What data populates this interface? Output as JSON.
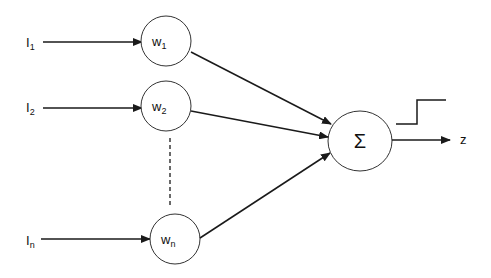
{
  "diagram": {
    "title": "",
    "type": "perceptron",
    "colors": {
      "stroke": "#1a1a1a",
      "background": "#ffffff"
    },
    "inputs": [
      {
        "base": "I",
        "sub": "1"
      },
      {
        "base": "I",
        "sub": "2"
      },
      {
        "base": "I",
        "sub": "n"
      }
    ],
    "weights": [
      {
        "base": "w",
        "sub": "1"
      },
      {
        "base": "w",
        "sub": "2"
      },
      {
        "base": "w",
        "sub": "n"
      }
    ],
    "summation": {
      "symbol": "Σ"
    },
    "activation": {
      "type": "step"
    },
    "output": {
      "label": "z"
    }
  }
}
